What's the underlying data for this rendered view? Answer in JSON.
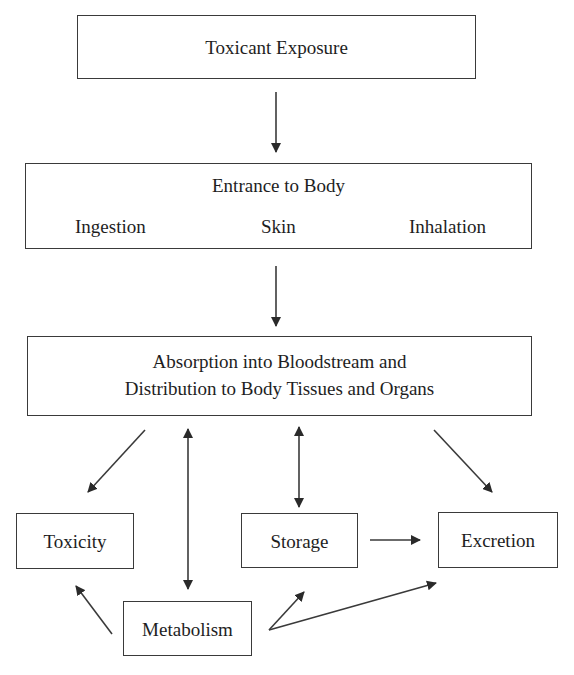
{
  "diagram": {
    "nodes": {
      "exposure": {
        "label": "Toxicant Exposure"
      },
      "entrance": {
        "label": "Entrance to Body",
        "routes": [
          "Ingestion",
          "Skin",
          "Inhalation"
        ]
      },
      "absorption": {
        "line1": "Absorption into Bloodstream and",
        "line2": "Distribution to Body Tissues and Organs"
      },
      "toxicity": {
        "label": "Toxicity"
      },
      "storage": {
        "label": "Storage"
      },
      "excretion": {
        "label": "Excretion"
      },
      "metabolism": {
        "label": "Metabolism"
      }
    },
    "edges": [
      {
        "from": "exposure",
        "to": "entrance",
        "type": "one-way"
      },
      {
        "from": "entrance",
        "to": "absorption",
        "type": "one-way"
      },
      {
        "from": "absorption",
        "to": "toxicity",
        "type": "one-way"
      },
      {
        "from": "absorption",
        "to": "metabolism",
        "type": "two-way"
      },
      {
        "from": "absorption",
        "to": "storage",
        "type": "two-way"
      },
      {
        "from": "absorption",
        "to": "excretion",
        "type": "one-way"
      },
      {
        "from": "storage",
        "to": "excretion",
        "type": "one-way"
      },
      {
        "from": "metabolism",
        "to": "toxicity",
        "type": "one-way"
      },
      {
        "from": "metabolism",
        "to": "storage",
        "type": "one-way"
      },
      {
        "from": "metabolism",
        "to": "excretion",
        "type": "one-way"
      }
    ],
    "colors": {
      "stroke": "#3a3a3a",
      "text": "#1e1e1e",
      "background": "#ffffff"
    }
  }
}
